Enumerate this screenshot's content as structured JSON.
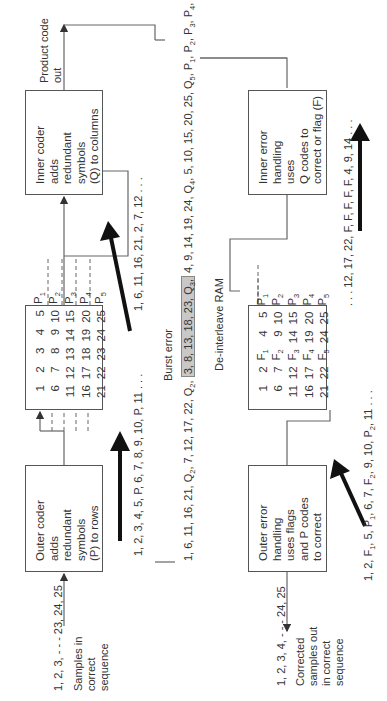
{
  "encoder": {
    "input_sequence": "1, 2, 3, - - - 23, 24, 25",
    "input_label": [
      "Samples in",
      "correct",
      "sequence"
    ],
    "outer_coder": [
      "Outer coder",
      "adds",
      "redundant",
      "symbols",
      "(P) to rows"
    ],
    "outer_coder_output": "1, 2, 3, 4, 5, P, 6, 7, 8, 9, 10, P, 11 . . .",
    "interleave_grid": [
      [
        "1",
        "2",
        "3",
        "4",
        "5",
        "P1"
      ],
      [
        "6",
        "7",
        "8",
        "9",
        "10",
        "P2"
      ],
      [
        "11",
        "12",
        "13",
        "14",
        "15",
        "P3"
      ],
      [
        "16",
        "17",
        "18",
        "19",
        "20",
        "P4"
      ],
      [
        "21",
        "22",
        "23",
        "24",
        "25",
        "P5"
      ]
    ],
    "interleave_output": "1, 6, 11, 16, 21, 2, 7, 12 . . .",
    "inner_coder": [
      "Inner coder",
      "adds",
      "redundant",
      "symbols",
      "(Q) to columns"
    ],
    "output_label": [
      "Product code",
      "out"
    ]
  },
  "channel": {
    "burst_label": "Burst error",
    "sequence_before": "1, 6, 11, 16, 21, Q2, 7, 12, 17, 22, Q2,",
    "sequence_burst": "3, 8, 13, 18, 23, Q3,",
    "sequence_after": "4, 9, 14, 19, 24, Q4, 5, 10, 15, 20, 25, Q5, P1, P2, P3, P4, P5, Q6"
  },
  "decoder": {
    "inner_error_handling": [
      "Inner error",
      "handling",
      "uses",
      "Q codes to",
      "correct or flag (F)"
    ],
    "inner_output": ". . . 12, 17, 22, F, F, F, F, F, 4, 9, 14 . . .",
    "deinterleave_label": "De-interleave RAM",
    "deinterleave_grid": [
      [
        "1",
        "2",
        "F1",
        "4",
        "5",
        "P1"
      ],
      [
        "6",
        "7",
        "F2",
        "9",
        "10",
        "P2"
      ],
      [
        "11",
        "12",
        "F3",
        "14",
        "15",
        "P3"
      ],
      [
        "16",
        "17",
        "F4",
        "19",
        "20",
        "P4"
      ],
      [
        "21",
        "22",
        "F5",
        "24",
        "25",
        "P5"
      ]
    ],
    "deinterleave_output": "1, 2, F1, 5, P1, 6, 7, F2, 9, 10, P2, 11 . . .",
    "outer_error_handling": [
      "Outer error",
      "handling",
      "uses flags",
      "and P codes",
      "to correct"
    ],
    "output_sequence": "1, 2, 3, 4, - - - 24, 25",
    "output_label": [
      "Corrected",
      "samples out",
      "in correct",
      "sequence"
    ]
  }
}
